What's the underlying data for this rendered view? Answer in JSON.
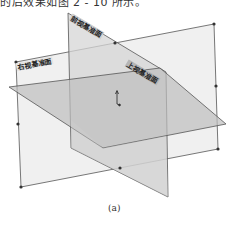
{
  "header": {
    "text_fragment": "的后效果如图 2 - 10 所示。"
  },
  "planes": {
    "front": {
      "label": "前视基准面",
      "fill": "#d9d9d9"
    },
    "right": {
      "label": "右视基准面",
      "fill": "#ececec"
    },
    "top": {
      "label": "上视基准面",
      "fill": "#c4c4c4"
    }
  },
  "origin": {
    "icon": "coordinate-origin-icon"
  },
  "colors": {
    "edge": "#555555",
    "handle": "#333333"
  },
  "caption": "(a)"
}
